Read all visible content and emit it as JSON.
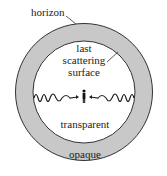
{
  "diagram": {
    "labels": {
      "horizon": "horizon",
      "last_scattering_line1": "last",
      "last_scattering_line2": "scattering",
      "last_scattering_line3": "surface",
      "transparent": "transparent",
      "opaque": "opaque"
    },
    "regions": [
      {
        "name": "opaque-shell",
        "label": "opaque",
        "color": "#c8c8c8"
      },
      {
        "name": "transparent-interior",
        "label": "transparent",
        "color": "#ffffff"
      }
    ],
    "elements": {
      "observer": "observer-figure",
      "light_waves": "wavy light rays traveling from surface to observer (both sides)"
    },
    "colors": {
      "shell_fill": "#c8c8c8",
      "outline": "#333333",
      "text": "#222222"
    }
  }
}
